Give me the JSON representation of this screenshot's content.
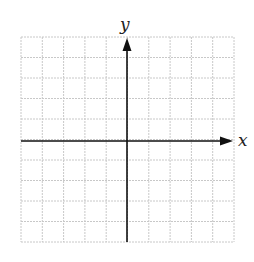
{
  "diagram": {
    "type": "coordinate-grid",
    "grid": {
      "columns": 10,
      "rows": 10,
      "color": "#c8c8c8",
      "style": "dotted"
    },
    "axes": {
      "x_label": "x",
      "y_label": "y",
      "color": "#111111",
      "arrows": [
        "positive-x",
        "positive-y"
      ]
    }
  }
}
